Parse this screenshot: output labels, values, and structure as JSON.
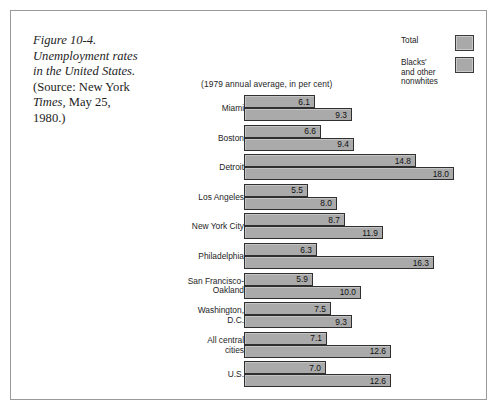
{
  "caption": {
    "line1": "Figure 10-4.",
    "line2": "Unemployment rates",
    "line3": "in the United States.",
    "line4_rom": "(Source: New York",
    "line5": "Times,",
    "line5_rom": " May 25,",
    "line6_rom": "1980.)"
  },
  "legend": {
    "items": [
      {
        "label": "Total",
        "color": "#aaaaaa"
      },
      {
        "label": "Blacks' and other nonwhites",
        "color": "#aaaaaa"
      }
    ],
    "item0_label": "Total",
    "item1_line1": "Blacks'",
    "item1_line2": "and other",
    "item1_line3": "nonwhites"
  },
  "chart_data": {
    "type": "bar",
    "orientation": "horizontal",
    "title": "Unemployment rates in the United States",
    "subtitle": "(1979 annual average, in per cent)",
    "xlabel": "",
    "ylabel": "",
    "xlim": [
      0,
      18.0
    ],
    "grid": false,
    "legend_position": "top-right",
    "categories": [
      "Miami",
      "Boston",
      "Detroit",
      "Los Angeles",
      "New York City",
      "Philadelphia",
      "San Francisco-Oakland",
      "Washington, D.C.",
      "All central cities",
      "U.S."
    ],
    "category_lines": [
      [
        "Miami"
      ],
      [
        "Boston"
      ],
      [
        "Detroit"
      ],
      [
        "Los Angeles"
      ],
      [
        "New York City"
      ],
      [
        "Philadelphia"
      ],
      [
        "San Francisco-",
        "Oakland"
      ],
      [
        "Washington,",
        "D.C."
      ],
      [
        "All central",
        "cities"
      ],
      [
        "U.S."
      ]
    ],
    "series": [
      {
        "name": "Total",
        "values": [
          6.1,
          6.6,
          14.8,
          5.5,
          8.7,
          6.3,
          5.9,
          7.5,
          7.1,
          7.0
        ],
        "labels": [
          "6.1",
          "6.6",
          "14.8",
          "5.5",
          "8.7",
          "6.3",
          "5.9",
          "7.5",
          "7.1",
          "7.0"
        ]
      },
      {
        "name": "Blacks' and other nonwhites",
        "values": [
          9.3,
          9.4,
          18.0,
          8.0,
          11.9,
          16.3,
          10.0,
          9.3,
          12.6,
          12.6
        ],
        "labels": [
          "9.3",
          "9.4",
          "18.0",
          "8.0",
          "11.9",
          "16.3",
          "10.0",
          "9.3",
          "12.6",
          "12.6"
        ]
      }
    ]
  }
}
